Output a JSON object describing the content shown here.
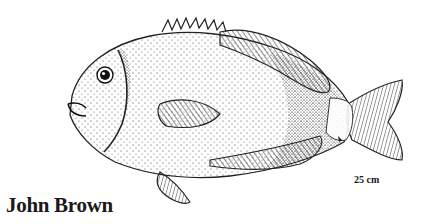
{
  "illustration": {
    "subject": "fish",
    "style": "stippled pen-and-ink drawing",
    "ink_color": "#1a1a1a",
    "background": "#ffffff"
  },
  "credit": {
    "artist": "John Brown"
  },
  "scale": {
    "label": "25 cm"
  }
}
